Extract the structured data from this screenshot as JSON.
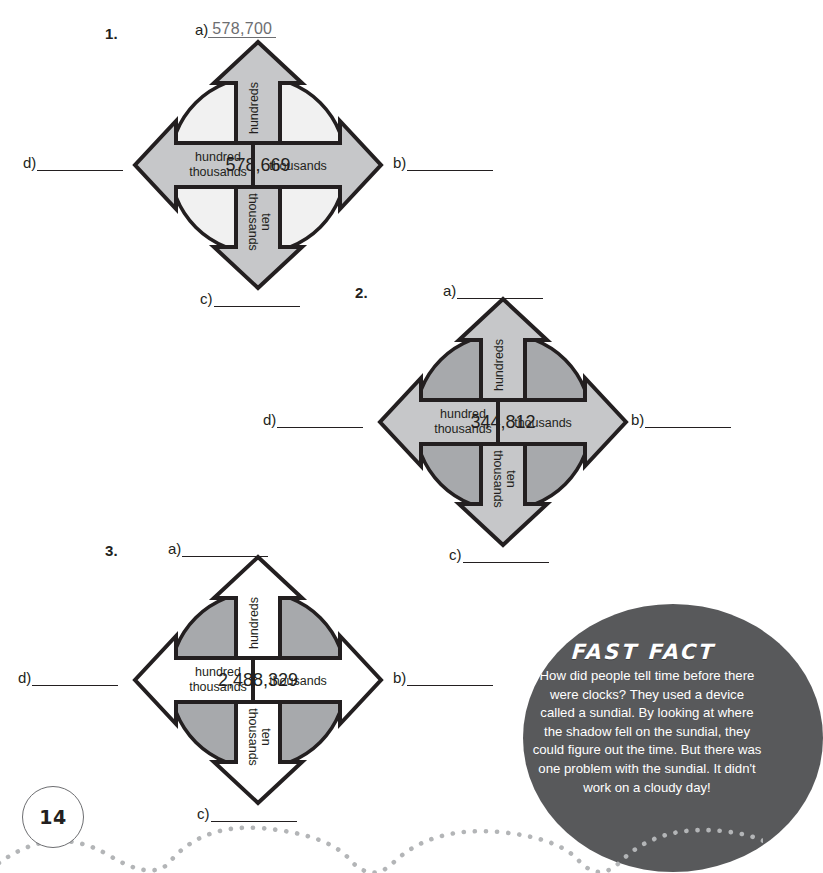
{
  "page": {
    "number": "14"
  },
  "problems": [
    {
      "number": "1.",
      "center_value": "578,669",
      "style": "light",
      "arrows": {
        "up": "hundreds",
        "down": "ten thousands",
        "left": "hundred thousands",
        "right": "thousands"
      },
      "blanks": {
        "a": {
          "label": "a)",
          "answer": "578,700"
        },
        "b": {
          "label": "b)",
          "answer": ""
        },
        "c": {
          "label": "c)",
          "answer": ""
        },
        "d": {
          "label": "d)",
          "answer": ""
        }
      }
    },
    {
      "number": "2.",
      "center_value": "344,812",
      "style": "medium",
      "arrows": {
        "up": "hundreds",
        "down": "ten thousands",
        "left": "hundred thousands",
        "right": "thousands"
      },
      "blanks": {
        "a": {
          "label": "a)",
          "answer": ""
        },
        "b": {
          "label": "b)",
          "answer": ""
        },
        "c": {
          "label": "c)",
          "answer": ""
        },
        "d": {
          "label": "d)",
          "answer": ""
        }
      }
    },
    {
      "number": "3.",
      "center_value": "2,488,329",
      "style": "white",
      "arrows": {
        "up": "hundreds",
        "down": "ten thousands",
        "left": "hundred thousands",
        "right": "thousands"
      },
      "blanks": {
        "a": {
          "label": "a)",
          "answer": ""
        },
        "b": {
          "label": "b)",
          "answer": ""
        },
        "c": {
          "label": "c)",
          "answer": ""
        },
        "d": {
          "label": "d)",
          "answer": ""
        }
      }
    }
  ],
  "fast_fact": {
    "title": "FAST FACT",
    "body": "How did people tell time before there were clocks? They used a device called a sundial. By looking at where the shadow fell on the sundial, they could figure out the time. But there was one problem with the sundial. It didn't work on a cloudy day!"
  },
  "colors": {
    "outline": "#231f20",
    "light_circle": "#f1f1f1",
    "light_arrow": "#c6c7c9",
    "medium_circle": "#a7a9ac",
    "medium_arrow": "#c6c7c9",
    "white_arrow": "#ffffff",
    "bubble": "#58595b",
    "answer_gray": "#6d6e71",
    "dot": "#b3b5b7"
  }
}
